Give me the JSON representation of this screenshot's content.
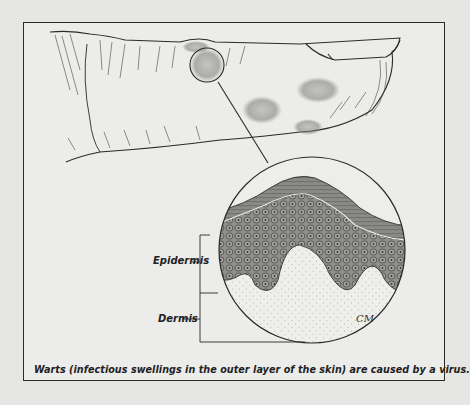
{
  "figure": {
    "labels": {
      "epidermis": "Epidermis",
      "dermis": "Dermis"
    },
    "caption": "Warts (infectious swellings in the outer layer of the skin) are caused by a virus.",
    "signature": "CM",
    "colors": {
      "background": "#e6e6e4",
      "frame": "#2b2b2b",
      "stratum_corneum": "#7a7a78",
      "epidermis_cells": "#8c8c8a",
      "dermis": "#ecece8"
    }
  }
}
